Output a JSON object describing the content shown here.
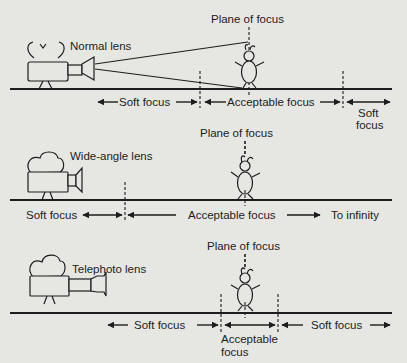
{
  "colors": {
    "background": "#e6e6e3",
    "ink": "#1d1d1d"
  },
  "panels": [
    {
      "lens": "Normal lens",
      "plane_label": "Plane of focus",
      "zones": {
        "near": "Soft focus",
        "middle": "Acceptable focus",
        "far_line1": "Soft",
        "far_line2": "focus"
      }
    },
    {
      "lens": "Wide-angle lens",
      "plane_label": "Plane of focus",
      "zones": {
        "near": "Soft focus",
        "middle": "Acceptable focus",
        "far": "To infinity"
      }
    },
    {
      "lens": "Telephoto lens",
      "plane_label": "Plane of focus",
      "zones": {
        "near": "Soft focus",
        "middle_line1": "Acceptable",
        "middle_line2": "focus",
        "far": "Soft focus"
      }
    }
  ]
}
